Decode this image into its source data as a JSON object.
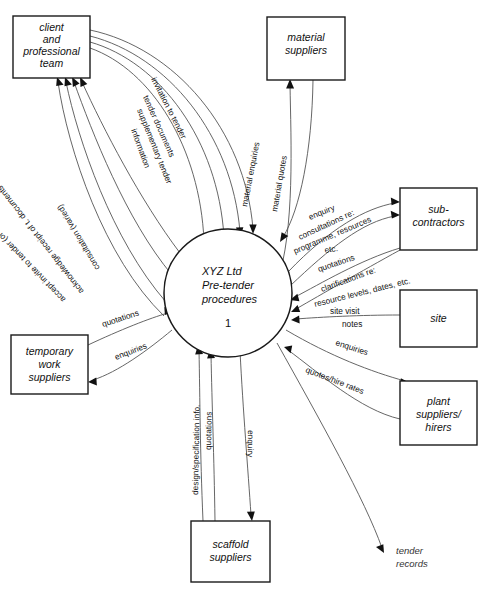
{
  "diagram": {
    "type": "data-flow-diagram",
    "background": "#ffffff",
    "line_color": "#555555",
    "box_color": "#1a1a1a"
  },
  "process": {
    "line1": "XYZ Ltd",
    "line2": "Pre-tender",
    "line3": "procedures",
    "number": "1"
  },
  "entities": {
    "client": {
      "line1": "client",
      "line2": "and",
      "line3": "professional",
      "line4": "team"
    },
    "material_suppliers": {
      "line1": "material",
      "line2": "suppliers"
    },
    "subcontractors": {
      "line1": "sub-",
      "line2": "contractors"
    },
    "site": {
      "line1": "site"
    },
    "plant": {
      "line1": "plant",
      "line2": "suppliers/",
      "line3": "hirers"
    },
    "temporary_work": {
      "line1": "temporary",
      "line2": "work",
      "line3": "suppliers"
    },
    "scaffold": {
      "line1": "scaffold",
      "line2": "suppliers"
    },
    "tender_records": {
      "line1": "tender",
      "line2": "records"
    }
  },
  "flows": {
    "invitation_to_tender": "invitation to tender",
    "tender_documents": "tender documents",
    "supplementary_tender": "supplementary tender",
    "information": "information",
    "accept_invite": "accept invite to tender (or decline)",
    "acknowledge_receipt": "acknowledge receipt of t. documents",
    "consultation_varied": "consultation (varied)",
    "material_enquiries": "material enquiries",
    "material_quotes": "material quotes",
    "enquiry_sub": "enquiry",
    "consultations_re": "consultations re:",
    "programme_resources": "programme, resources",
    "etc": "etc.",
    "quotations_sub": "quotations",
    "clarifications_re": "clarifications re:",
    "resource_levels": "resource levels, dates, etc.",
    "site_visit": "site  visit",
    "notes": "notes",
    "enquiries_plant": "enquiries",
    "quotes_hire_rates": "quotes/hire rates",
    "quotations_temp": "quotations",
    "enquiries_temp": "enquiries",
    "design_spec_info": "design/specification info.",
    "quotations_scaffold": "quotations",
    "enquiry_scaffold": "enquiry"
  }
}
